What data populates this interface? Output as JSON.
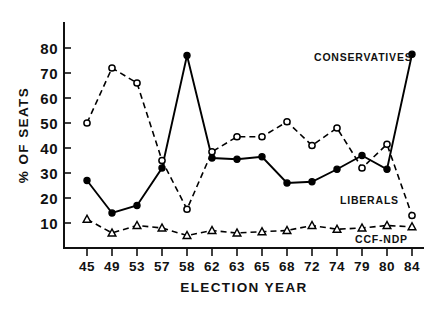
{
  "chart_data": {
    "type": "line",
    "title": "",
    "xlabel": "ELECTION YEAR",
    "ylabel": "% OF SEATS",
    "categories": [
      "45",
      "49",
      "53",
      "57",
      "58",
      "62",
      "63",
      "65",
      "68",
      "72",
      "74",
      "79",
      "80",
      "84"
    ],
    "ylim": [
      0,
      85
    ],
    "yticks": [
      10,
      20,
      30,
      40,
      50,
      60,
      70,
      80
    ],
    "ytick_labels": [
      "10",
      "20",
      "30",
      "40",
      "50",
      "60",
      "70",
      "80"
    ],
    "grid": false,
    "legend": "inline-annotations",
    "series": [
      {
        "name": "CONSERVATIVES",
        "marker": "filled-circle",
        "linestyle": "solid",
        "values": [
          27,
          14,
          17,
          32,
          77,
          36,
          35.5,
          36.5,
          26,
          26.5,
          31.5,
          37,
          31.5,
          77.5
        ]
      },
      {
        "name": "LIBERALS",
        "marker": "open-circle",
        "linestyle": "dashed",
        "values": [
          50,
          72,
          66,
          35,
          15.5,
          38.5,
          44.5,
          44.5,
          50.5,
          41,
          48,
          32,
          41.5,
          13
        ]
      },
      {
        "name": "CCF-NDP",
        "marker": "open-triangle",
        "linestyle": "dashed",
        "values": [
          11.5,
          6,
          9,
          8,
          5,
          7,
          6,
          6.5,
          7,
          9,
          7.5,
          8,
          9,
          8.5
        ]
      }
    ],
    "annotations": [
      {
        "text": "CONSERVATIVES",
        "x_px": 314,
        "y_px": 61
      },
      {
        "text": "LIBERALS",
        "x_px": 340,
        "y_px": 204
      },
      {
        "text": "CCF-NDP",
        "x_px": 355,
        "y_px": 243
      }
    ]
  },
  "axes": {
    "x_axis_title": "ELECTION YEAR",
    "y_axis_title": "% OF SEATS"
  }
}
